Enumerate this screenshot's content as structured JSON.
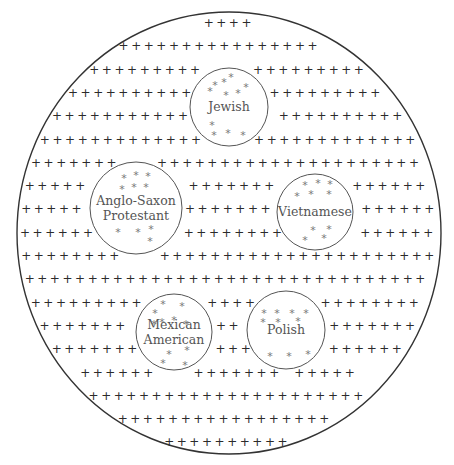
{
  "diagram": {
    "title": "",
    "majority_symbol": "+",
    "minority_symbol": "*",
    "majority_rows": [
      {
        "segments": [
          4
        ]
      },
      {
        "segments": [
          16
        ]
      },
      {
        "segments": [
          9,
          9
        ]
      },
      {
        "segments": [
          10,
          10
        ]
      },
      {
        "segments": [
          11,
          11
        ]
      },
      {
        "segments": [
          13,
          13
        ]
      },
      {
        "segments": [
          32
        ]
      },
      {
        "segments": [
          6,
          8,
          8
        ]
      },
      {
        "segments": [
          7,
          8,
          7
        ]
      },
      {
        "segments": [
          7,
          8,
          7
        ]
      },
      {
        "segments": [
          32
        ]
      },
      {
        "segments": [
          32
        ]
      },
      {
        "segments": [
          32
        ]
      },
      {
        "segments": [
          9,
          4,
          8
        ]
      },
      {
        "segments": [
          7,
          2,
          7
        ]
      },
      {
        "segments": [
          7,
          4,
          7
        ]
      },
      {
        "segments": [
          25
        ]
      },
      {
        "segments": [
          20
        ]
      },
      {
        "segments": [
          16
        ]
      },
      {
        "segments": [
          4
        ]
      }
    ],
    "groups": [
      {
        "name": "Jewish",
        "lines": [
          "Jewish"
        ],
        "stars": 11
      },
      {
        "name": "Anglo-Saxon Protestant",
        "lines": [
          "Anglo-Saxon",
          "Protestant"
        ],
        "stars": 10
      },
      {
        "name": "Vietnamese",
        "lines": [
          "Vietnamese"
        ],
        "stars": 10
      },
      {
        "name": "Mexican American",
        "lines": [
          "Mexican",
          "American"
        ],
        "stars": 11
      },
      {
        "name": "Polish",
        "lines": [
          "Polish"
        ],
        "stars": 10
      }
    ]
  }
}
